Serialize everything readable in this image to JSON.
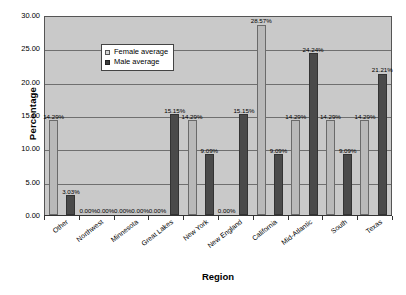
{
  "chart_data": {
    "type": "bar",
    "title": "",
    "xlabel": "Region",
    "ylabel": "Percentage",
    "ylim": [
      0,
      30
    ],
    "ytick_step": 5,
    "ytick_labels": [
      "30.00",
      "25.00",
      "20.00",
      "15.00",
      "10.00",
      "5.00",
      "0.00"
    ],
    "grid": true,
    "legend_position": "upper-left-inside",
    "categories": [
      "Other",
      "Northwest",
      "Minnesota",
      "Great Lakes",
      "New York",
      "New England",
      "California",
      "Mid-Atlantic",
      "South",
      "Texas"
    ],
    "series": [
      {
        "name": "Female average",
        "color": "#b9b9b9",
        "values": [
          14.29,
          0.0,
          0.0,
          0.0,
          14.29,
          0.0,
          28.57,
          14.29,
          14.29,
          14.29
        ],
        "labels": [
          "14.29%",
          "0.00%",
          "0.00%",
          "0.00%",
          "14.29%",
          "0.00%",
          "28.57%",
          "14.29%",
          "14.29%",
          "14.29%"
        ]
      },
      {
        "name": "Male average",
        "color": "#4a4a4a",
        "values": [
          3.03,
          0.0,
          0.0,
          15.15,
          9.09,
          15.15,
          9.09,
          24.24,
          9.09,
          21.21
        ],
        "labels": [
          "3.03%",
          "0.00%",
          "0.00%",
          "15.15%",
          "9.09%",
          "15.15%",
          "9.09%",
          "24.24%",
          "9.09%",
          "21.21%"
        ]
      }
    ]
  },
  "legend": {
    "items": [
      {
        "label": "Female average",
        "key": "female"
      },
      {
        "label": "Male average",
        "key": "male"
      }
    ]
  },
  "colors": {
    "plot_background": "#c9c9c9",
    "gridline": "#6f6f6f",
    "female_bar": "#b9b9b9",
    "male_bar": "#4a4a4a",
    "axis": "#333333",
    "text": "#000000"
  }
}
